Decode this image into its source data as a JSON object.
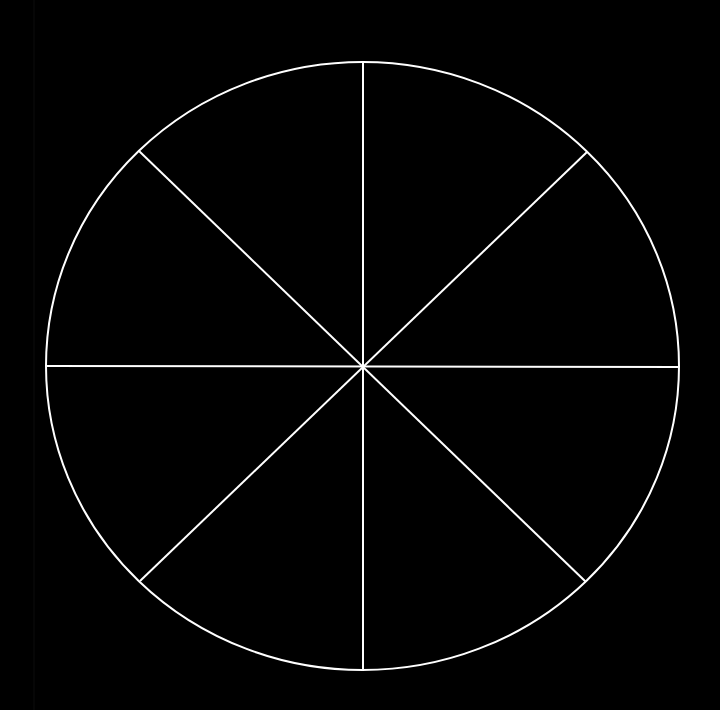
{
  "diagram": {
    "type": "divided-circle",
    "sector_count": 8,
    "background_color": "#000000",
    "stroke_color": "#FFFFFF",
    "stroke_width": 2,
    "circle": {
      "cx": 362.5,
      "cy": 366,
      "rx": 316.5,
      "ry": 304
    },
    "dividers": [
      {
        "name": "vertical",
        "x1": 363,
        "y1": 62,
        "x2": 363,
        "y2": 670
      },
      {
        "name": "horizontal",
        "x1": 46,
        "y1": 366,
        "x2": 679,
        "y2": 367
      },
      {
        "name": "diagonal-nw-se",
        "x1": 139,
        "y1": 151,
        "x2": 586,
        "y2": 582
      },
      {
        "name": "diagonal-ne-sw",
        "x1": 587,
        "y1": 152,
        "x2": 140,
        "y2": 581
      }
    ]
  }
}
